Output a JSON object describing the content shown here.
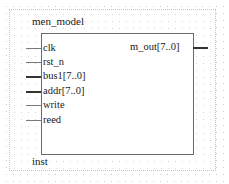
{
  "symbol": {
    "module_name": "men_model",
    "instance_label": "inst",
    "inputs": [
      {
        "name": "clk",
        "bus": false
      },
      {
        "name": "rst_n",
        "bus": false
      },
      {
        "name": "bus1[7..0]",
        "bus": true
      },
      {
        "name": "addr[7..0]",
        "bus": true
      },
      {
        "name": "write",
        "bus": false
      },
      {
        "name": "reed",
        "bus": false
      }
    ],
    "outputs": [
      {
        "name": "m_out[7..0]",
        "bus": true
      }
    ]
  }
}
